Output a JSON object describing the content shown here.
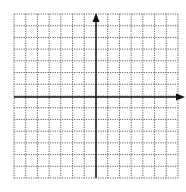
{
  "diagram": {
    "type": "coordinate-grid",
    "grid": {
      "columns": 14,
      "rows": 14,
      "left": 14,
      "top": 14,
      "right": 178,
      "bottom": 178,
      "line_style": "dotted",
      "line_color": "#555555"
    },
    "axes": {
      "x_axis_y": 97,
      "y_axis_x": 96,
      "color": "#111111",
      "x_arrow": "right",
      "y_arrow": "up",
      "x_arrow_tip": 185,
      "y_arrow_tip": 13
    },
    "labels": []
  }
}
